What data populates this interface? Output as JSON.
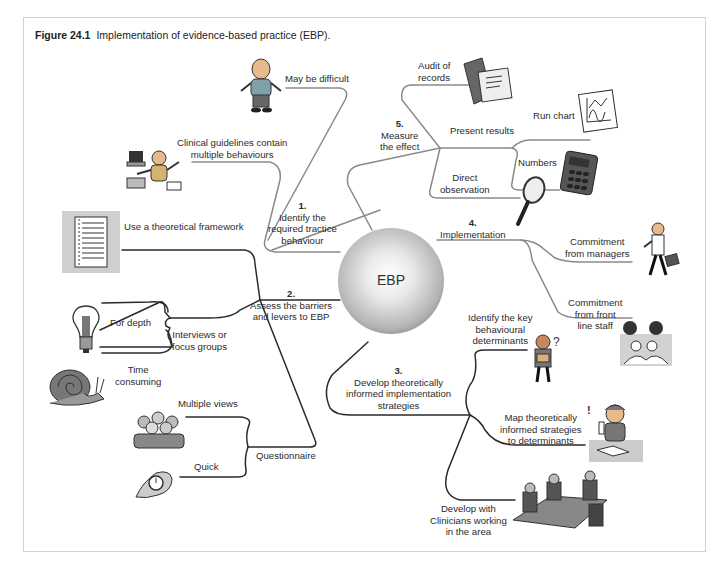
{
  "figure": {
    "number": "Figure 24.1",
    "title": "Implementation of evidence-based practice (EBP)."
  },
  "center": {
    "label": "EBP"
  },
  "branches": [
    {
      "number": "1.",
      "label_lines": [
        "Identify the",
        "required tractice",
        "behaviour"
      ],
      "children": [
        {
          "label_lines": [
            "May be difficult"
          ],
          "icon": "confused-man-icon"
        },
        {
          "label_lines": [
            "Clinical guidelines contain",
            "multiple behaviours"
          ],
          "icon": "multitasking-man-icon"
        }
      ]
    },
    {
      "number": "2.",
      "label_lines": [
        "Assess the barriers",
        "and levers to EBP"
      ],
      "children": [
        {
          "label_lines": [
            "Use a theoretical framework"
          ],
          "icon": "document-icon"
        },
        {
          "label_lines": [
            "Interviews or",
            "focus groups"
          ],
          "children": [
            {
              "label_lines": [
                "For depth"
              ],
              "icon": "lightbulb-icon"
            },
            {
              "label_lines": [
                "Time",
                "consuming"
              ],
              "icon": "snail-icon"
            }
          ]
        },
        {
          "label_lines": [
            "Questionnaire"
          ],
          "children": [
            {
              "label_lines": [
                "Multiple views"
              ],
              "icon": "group-of-people-icon"
            },
            {
              "label_lines": [
                "Quick"
              ],
              "icon": "stopwatch-icon"
            }
          ]
        }
      ]
    },
    {
      "number": "3.",
      "label_lines": [
        "Develop theoretically",
        "informed implementation",
        "strategies"
      ],
      "children": [
        {
          "label_lines": [
            "Identify the key",
            "behavioural",
            "determinants"
          ],
          "icon": "puzzled-person-icon"
        },
        {
          "label_lines": [
            "Map theoretically",
            "informed strategies",
            "to determinants"
          ],
          "icon": "thinking-person-icon"
        },
        {
          "label_lines": [
            "Develop with",
            "Clinicians working",
            "in the area"
          ],
          "icon": "meeting-table-icon"
        }
      ]
    },
    {
      "number": "4.",
      "label_lines": [
        "Implementation"
      ],
      "children": [
        {
          "label_lines": [
            "Commitment",
            "from managers"
          ],
          "icon": "businessman-icon"
        },
        {
          "label_lines": [
            "Commitment",
            "from front",
            "line staff"
          ],
          "icon": "staff-discussion-icon"
        }
      ]
    },
    {
      "number": "5.",
      "label_lines": [
        "Measure",
        "the effect"
      ],
      "children": [
        {
          "label_lines": [
            "Audit of",
            "records"
          ],
          "icon": "records-folder-icon"
        },
        {
          "label_lines": [
            "Present results"
          ],
          "children": [
            {
              "label_lines": [
                "Run chart"
              ],
              "icon": "run-chart-icon"
            },
            {
              "label_lines": [
                "Numbers"
              ],
              "icon": "calculator-icon"
            }
          ]
        },
        {
          "label_lines": [
            "Direct",
            "observation"
          ],
          "icon": "magnifying-glass-icon"
        }
      ]
    }
  ],
  "colors": {
    "frame_border": "#d2d2d2",
    "line_light": "#8a8a8a",
    "line_dark": "#2a2a2a",
    "text": "#2b2b2b",
    "sphere_light": "#ffffff",
    "sphere_dark": "#555555"
  }
}
